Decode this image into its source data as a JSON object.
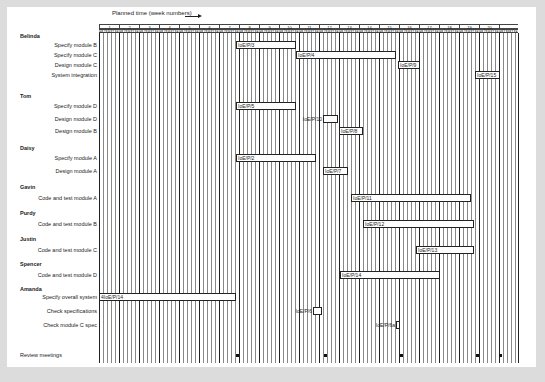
{
  "caption": "Planned time (week numbers)",
  "grid": {
    "x0": 99,
    "week_width": 20,
    "weeks": [
      "1",
      "2",
      "3",
      "4",
      "5",
      "6",
      "7",
      "8",
      "9",
      "10",
      "11",
      "12",
      "13",
      "14",
      "15",
      "16",
      "17",
      "18",
      "19",
      "20",
      ""
    ],
    "days": [
      "M",
      "T",
      "W",
      "T",
      "F"
    ],
    "top": 24,
    "bottom": 363
  },
  "people": [
    {
      "name": "Belinda",
      "y": 36
    },
    {
      "name": "Tom",
      "y": 96
    },
    {
      "name": "Daisy",
      "y": 148
    },
    {
      "name": "Gavin",
      "y": 187
    },
    {
      "name": "Purdy",
      "y": 213
    },
    {
      "name": "Justin",
      "y": 239
    },
    {
      "name": "Spencer",
      "y": 264
    },
    {
      "name": "Amanda",
      "y": 289
    }
  ],
  "tasks": [
    {
      "label": "Specify module B",
      "y": 45,
      "bar": {
        "id": "IoE/P/3",
        "x1": 236,
        "x2": 296
      }
    },
    {
      "label": "Specify module C",
      "y": 55,
      "bar": {
        "id": "IoE/P/4",
        "x1": 296,
        "x2": 396
      }
    },
    {
      "label": "Design module C",
      "y": 65,
      "bar": {
        "id": "IoE/P/9",
        "x1": 398,
        "x2": 420
      }
    },
    {
      "label": "System integration",
      "y": 75,
      "bar": {
        "id": "IoE/P/15",
        "x1": 475,
        "x2": 500
      }
    },
    {
      "label": "Specify module D",
      "y": 106,
      "bar": {
        "id": "IoE/P/5",
        "x1": 236,
        "x2": 296
      }
    },
    {
      "label": "Design module D",
      "y": 119,
      "bar": {
        "id": "IoE/P/10",
        "x1": 323,
        "x2": 338,
        "label_outside": true
      }
    },
    {
      "label": "Design module B",
      "y": 131,
      "bar": {
        "id": "IoE/P/8",
        "x1": 339,
        "x2": 363
      }
    },
    {
      "label": "Specify module A",
      "y": 158,
      "bar": {
        "id": "IoE/P/2",
        "x1": 236,
        "x2": 316
      }
    },
    {
      "label": "Design module A",
      "y": 171,
      "bar": {
        "id": "IoE/P/7",
        "x1": 323,
        "x2": 348
      }
    },
    {
      "label": "Code and test module A",
      "y": 198,
      "bar": {
        "id": "IoE/P/11",
        "x1": 351,
        "x2": 471
      }
    },
    {
      "label": "Code and test module B",
      "y": 224,
      "bar": {
        "id": "IoE/P/12",
        "x1": 363,
        "x2": 474
      }
    },
    {
      "label": "Code and test module C",
      "y": 250,
      "bar": {
        "id": "IoE/P/13",
        "x1": 416,
        "x2": 474
      }
    },
    {
      "label": "Code and test module D",
      "y": 275,
      "bar": {
        "id": "IoE/P/14",
        "x1": 340,
        "x2": 440
      }
    },
    {
      "label": "Specify overall system",
      "y": 297,
      "bar": {
        "id": "4IoE/P/14",
        "x1": 99,
        "x2": 236
      }
    },
    {
      "label": "Check specifications",
      "y": 311,
      "bar": {
        "id": "IoE/P/6",
        "x1": 313,
        "x2": 322,
        "label_outside": true
      }
    },
    {
      "label": "Check module C spec",
      "y": 325,
      "bar": {
        "id": "IoE/P/6a",
        "x1": 396,
        "x2": 400,
        "label_outside": true
      }
    }
  ],
  "review": {
    "label": "Review meetings",
    "y": 355,
    "dots_x": [
      237,
      325,
      401,
      477,
      500
    ]
  },
  "chart_data": {
    "type": "gantt",
    "title": "",
    "xlabel": "Planned time (week numbers)",
    "x_ticks": [
      1,
      2,
      3,
      4,
      5,
      6,
      7,
      8,
      9,
      10,
      11,
      12,
      13,
      14,
      15,
      16,
      17,
      18,
      19,
      20
    ],
    "day_ticks": [
      "M",
      "T",
      "W",
      "T",
      "F"
    ],
    "groups": [
      {
        "person": "Belinda",
        "tasks": [
          {
            "task": "Specify module B",
            "id": "IoE/P/3",
            "start_week": 8.0,
            "end_week": 10.9
          },
          {
            "task": "Specify module C",
            "id": "IoE/P/4",
            "start_week": 11.0,
            "end_week": 15.9
          },
          {
            "task": "Design module C",
            "id": "IoE/P/9",
            "start_week": 16.0,
            "end_week": 16.9
          },
          {
            "task": "System integration",
            "id": "IoE/P/15",
            "start_week": 19.9,
            "end_week": 20.9
          }
        ]
      },
      {
        "person": "Tom",
        "tasks": [
          {
            "task": "Specify module D",
            "id": "IoE/P/5",
            "start_week": 8.0,
            "end_week": 10.9
          },
          {
            "task": "Design module D",
            "id": "IoE/P/10",
            "start_week": 12.2,
            "end_week": 12.9
          },
          {
            "task": "Design module B",
            "id": "IoE/P/8",
            "start_week": 13.0,
            "end_week": 14.2
          }
        ]
      },
      {
        "person": "Daisy",
        "tasks": [
          {
            "task": "Specify module A",
            "id": "IoE/P/2",
            "start_week": 8.0,
            "end_week": 11.8
          },
          {
            "task": "Design module A",
            "id": "IoE/P/7",
            "start_week": 12.2,
            "end_week": 13.4
          }
        ]
      },
      {
        "person": "Gavin",
        "tasks": [
          {
            "task": "Code and test module A",
            "id": "IoE/P/11",
            "start_week": 13.6,
            "end_week": 19.6
          }
        ]
      },
      {
        "person": "Purdy",
        "tasks": [
          {
            "task": "Code and test module B",
            "id": "IoE/P/12",
            "start_week": 14.2,
            "end_week": 19.8
          }
        ]
      },
      {
        "person": "Justin",
        "tasks": [
          {
            "task": "Code and test module C",
            "id": "IoE/P/13",
            "start_week": 16.9,
            "end_week": 19.8
          }
        ]
      },
      {
        "person": "Spencer",
        "tasks": [
          {
            "task": "Code and test module D",
            "id": "IoE/P/14",
            "start_week": 13.1,
            "end_week": 18.1
          }
        ]
      },
      {
        "person": "Amanda",
        "tasks": [
          {
            "task": "Specify overall system",
            "id": "4IoE/P/14",
            "start_week": 1.0,
            "end_week": 7.9
          },
          {
            "task": "Check specifications",
            "id": "IoE/P/6",
            "start_week": 11.7,
            "end_week": 12.2
          },
          {
            "task": "Check module C spec",
            "id": "IoE/P/6a",
            "start_week": 15.9,
            "end_week": 16.1
          }
        ]
      }
    ],
    "milestones": {
      "label": "Review meetings",
      "weeks": [
        8,
        12,
        16,
        19.9,
        21
      ]
    },
    "xlim": [
      1,
      21
    ],
    "grid": true
  }
}
